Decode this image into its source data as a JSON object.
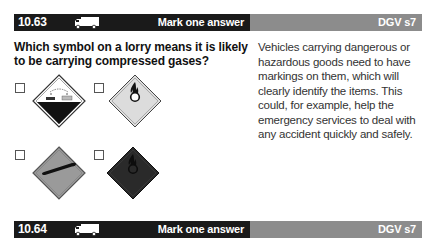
{
  "questions": [
    {
      "number": "10.63",
      "vehicle_icon": "lorry-icon",
      "instruction": "Mark one answer",
      "category": "DGV s7",
      "text": "Which symbol on a lorry means it is likely to be carrying compressed gases?",
      "options": [
        {
          "id": "a",
          "symbol": "corrosive-hazard-sign",
          "checked": false
        },
        {
          "id": "b",
          "symbol": "oxidising-agent-sign",
          "checked": false
        },
        {
          "id": "c",
          "symbol": "compressed-gas-cylinder-sign",
          "checked": false
        },
        {
          "id": "d",
          "symbol": "flame-over-circle-dark-sign",
          "checked": false
        }
      ],
      "explanation": "Vehicles carrying dangerous or hazardous goods need to have markings on them, which will clearly identify the items. This could, for example, help the emergency services to deal with any accident quickly and safely."
    },
    {
      "number": "10.64",
      "vehicle_icon": "lorry-icon",
      "instruction": "Mark one answer",
      "category": "DGV s7"
    }
  ]
}
